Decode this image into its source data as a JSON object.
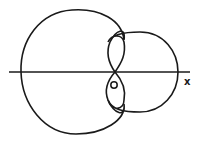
{
  "diagram": {
    "labels": {
      "origin": "O",
      "x_axis": "x"
    },
    "stroke_color": "#1a1a1a",
    "background": "#ffffff"
  }
}
